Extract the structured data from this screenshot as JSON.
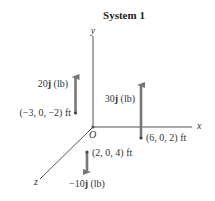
{
  "title": "System 1",
  "axes": {
    "x_label": "x",
    "y_label": "y",
    "z_label": "z",
    "origin_label": "O"
  },
  "forces": [
    {
      "magnitude": "20",
      "unit_vector": "j",
      "unit": "(lb)",
      "direction": "up",
      "position": "(−3, 0, −2) ft"
    },
    {
      "magnitude": "30",
      "unit_vector": "j",
      "unit": "(lb)",
      "direction": "up",
      "position": "(6, 0, 2) ft"
    },
    {
      "magnitude": "−10",
      "unit_vector": "j",
      "unit": "(lb)",
      "direction": "down",
      "position": "(2, 0, 4) ft"
    }
  ],
  "colors": {
    "axis": "#555555",
    "arrow": "#777777",
    "text": "#333333"
  }
}
